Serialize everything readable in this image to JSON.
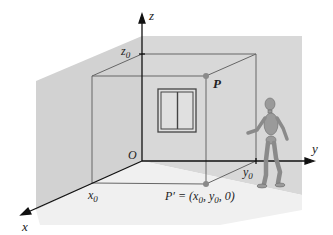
{
  "diagram": {
    "axes": {
      "x": {
        "label": "x"
      },
      "y": {
        "label": "y"
      },
      "z": {
        "label": "z"
      },
      "origin": {
        "label": "O"
      }
    },
    "ticks": {
      "x0": {
        "label": "x",
        "sub": "0"
      },
      "y0": {
        "label": "y",
        "sub": "0"
      },
      "z0": {
        "label": "z",
        "sub": "0"
      }
    },
    "points": {
      "P": {
        "label": "P"
      },
      "P_prime": {
        "label": "P′ = (x",
        "sub1": "0",
        "mid": ", y",
        "sub2": "0",
        "tail": ", 0)"
      }
    },
    "colors": {
      "wall": "#d6d6d6",
      "floor": "#ebebeb",
      "line": "#555555",
      "axis": "#111111",
      "point": "#8a8a8a",
      "figure": "#9a9a9a"
    },
    "objects": [
      "window",
      "walking-figure"
    ]
  }
}
